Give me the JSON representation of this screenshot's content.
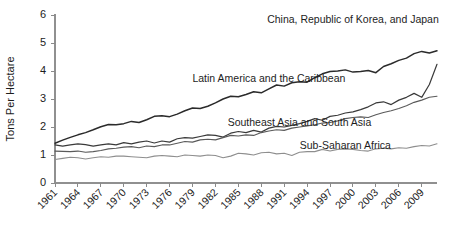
{
  "chart_data": {
    "type": "line",
    "title": "",
    "subtitle": "",
    "xlabel": "",
    "ylabel": "Tons Per Hectare",
    "xlim": [
      1961,
      2011
    ],
    "ylim": [
      0,
      6
    ],
    "grid": false,
    "legend_position": "inline-annotations",
    "yticks": [
      0,
      1,
      2,
      3,
      4,
      5,
      6
    ],
    "ytick_labels": [
      "0",
      "1",
      "2",
      "3",
      "4",
      "5",
      "6"
    ],
    "xticks": [
      1961,
      1964,
      1967,
      1970,
      1973,
      1976,
      1979,
      1982,
      1985,
      1988,
      1991,
      1994,
      1997,
      2000,
      2003,
      2006,
      2009
    ],
    "xtick_labels": [
      "1961",
      "1964",
      "1967",
      "1970",
      "1973",
      "1976",
      "1979",
      "1982",
      "1985",
      "1988",
      "1991",
      "1994",
      "1997",
      "2000",
      "2003",
      "2006",
      "2009"
    ],
    "x": [
      1961,
      1962,
      1963,
      1964,
      1965,
      1966,
      1967,
      1968,
      1969,
      1970,
      1971,
      1972,
      1973,
      1974,
      1975,
      1976,
      1977,
      1978,
      1979,
      1980,
      1981,
      1982,
      1983,
      1984,
      1985,
      1986,
      1987,
      1988,
      1989,
      1990,
      1991,
      1992,
      1993,
      1994,
      1995,
      1996,
      1997,
      1998,
      1999,
      2000,
      2001,
      2002,
      2003,
      2004,
      2005,
      2006,
      2007,
      2008,
      2009,
      2010,
      2011
    ],
    "series": [
      {
        "name": "China, Republic of Korea, and Japan",
        "color": "#2b2b2b",
        "width": 1.5,
        "label_x": 2000,
        "label_y": 5.72,
        "values": [
          1.42,
          1.53,
          1.63,
          1.72,
          1.8,
          1.9,
          2.01,
          2.09,
          2.08,
          2.12,
          2.2,
          2.16,
          2.26,
          2.38,
          2.4,
          2.37,
          2.46,
          2.58,
          2.68,
          2.66,
          2.74,
          2.86,
          3.0,
          3.1,
          3.08,
          3.16,
          3.26,
          3.22,
          3.36,
          3.5,
          3.46,
          3.58,
          3.62,
          3.6,
          3.76,
          3.9,
          3.98,
          4.0,
          4.04,
          3.96,
          3.98,
          4.02,
          3.94,
          4.16,
          4.26,
          4.38,
          4.46,
          4.62,
          4.7,
          4.64,
          4.72
        ]
      },
      {
        "name": "Latin America and the Caribbean",
        "color": "#3a3a3a",
        "width": 1.2,
        "label_x": 1989,
        "label_y": 3.62,
        "values": [
          1.36,
          1.32,
          1.36,
          1.4,
          1.37,
          1.32,
          1.36,
          1.4,
          1.36,
          1.44,
          1.4,
          1.46,
          1.5,
          1.43,
          1.5,
          1.46,
          1.58,
          1.62,
          1.6,
          1.66,
          1.72,
          1.7,
          1.64,
          1.78,
          1.84,
          1.8,
          1.88,
          1.82,
          1.96,
          2.02,
          2.0,
          2.06,
          2.12,
          2.2,
          2.3,
          2.24,
          2.38,
          2.42,
          2.5,
          2.54,
          2.62,
          2.72,
          2.86,
          2.9,
          2.8,
          2.96,
          3.06,
          3.2,
          3.06,
          3.52,
          4.24
        ]
      },
      {
        "name": "Southeast Asia and South Asia",
        "color": "#5a5a5a",
        "width": 1.1,
        "label_x": 1993,
        "label_y": 2.05,
        "values": [
          1.14,
          1.13,
          1.12,
          1.14,
          1.1,
          1.12,
          1.16,
          1.22,
          1.24,
          1.28,
          1.3,
          1.26,
          1.32,
          1.3,
          1.36,
          1.36,
          1.42,
          1.48,
          1.46,
          1.54,
          1.56,
          1.54,
          1.62,
          1.7,
          1.68,
          1.72,
          1.7,
          1.8,
          1.86,
          1.9,
          1.88,
          1.96,
          2.0,
          2.04,
          2.08,
          2.14,
          2.16,
          2.22,
          2.3,
          2.34,
          2.36,
          2.34,
          2.44,
          2.52,
          2.58,
          2.66,
          2.76,
          2.88,
          2.96,
          3.06,
          3.1
        ]
      },
      {
        "name": "Sub-Saharan Africa",
        "color": "#8e8e8e",
        "width": 1.1,
        "label_x": 1999,
        "label_y": 1.22,
        "values": [
          0.84,
          0.88,
          0.92,
          0.9,
          0.86,
          0.9,
          0.94,
          0.92,
          0.96,
          0.96,
          0.94,
          0.92,
          0.9,
          0.96,
          0.98,
          0.96,
          0.94,
          1.0,
          0.98,
          0.96,
          1.0,
          0.98,
          0.9,
          0.96,
          1.06,
          1.04,
          1.0,
          1.08,
          1.1,
          1.04,
          1.06,
          0.98,
          1.1,
          1.12,
          1.12,
          1.2,
          1.14,
          1.2,
          1.22,
          1.2,
          1.16,
          1.14,
          1.22,
          1.24,
          1.22,
          1.26,
          1.24,
          1.3,
          1.34,
          1.32,
          1.4
        ]
      }
    ]
  },
  "annotations": [
    {
      "id": "china-korea-japan",
      "text": "China, Republic of Korea, and Japan"
    },
    {
      "id": "latin-america-caribbean",
      "text": "Latin America and the Caribbean"
    },
    {
      "id": "southeast-south-asia",
      "text": "Southeast Asia and South Asia"
    },
    {
      "id": "sub-saharan-africa",
      "text": "Sub-Saharan Africa"
    }
  ],
  "axes": {
    "y_title": "Tons Per Hectare"
  }
}
